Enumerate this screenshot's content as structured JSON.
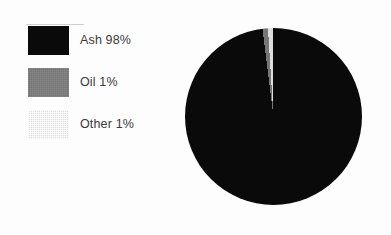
{
  "figure": {
    "background_color": "#fdfdfd",
    "text_color": "#3a3a3a"
  },
  "chart_data": {
    "type": "pie",
    "title": "",
    "categories": [
      "Ash",
      "Oil",
      "Other"
    ],
    "values": [
      98,
      1,
      1
    ],
    "value_unit": "%",
    "labels": [
      "Ash 98%",
      "Oil 1%",
      "Other 1%"
    ],
    "colors": [
      "#0a0a0a",
      "#767676",
      "#dedede"
    ],
    "legend_position": "left",
    "grid": false,
    "start_angle_deg": 0,
    "direction": "clockwise"
  },
  "legend": {
    "items": [
      {
        "label": "Ash 98%",
        "name": "Ash",
        "value": 98,
        "color": "#0a0a0a",
        "swatch": "solid-black"
      },
      {
        "label": "Oil 1%",
        "name": "Oil",
        "value": 1,
        "color": "#767676",
        "swatch": "medium-gray"
      },
      {
        "label": "Other 1%",
        "name": "Other",
        "value": 1,
        "color": "#dedede",
        "swatch": "light-gray-halftone"
      }
    ]
  }
}
